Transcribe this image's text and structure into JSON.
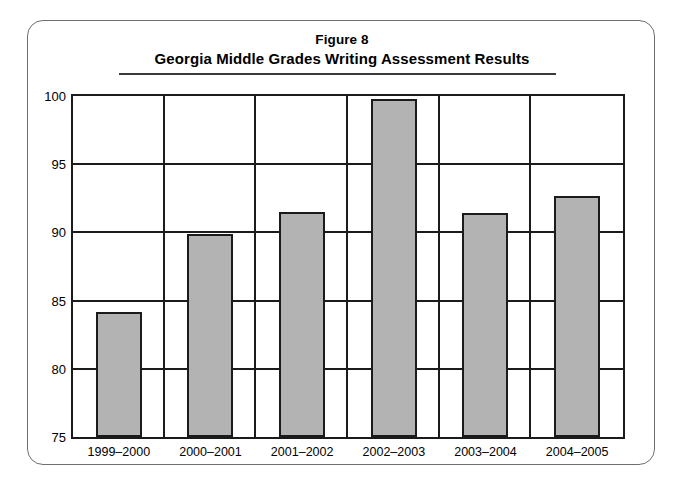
{
  "figure": {
    "title_line_1": "Figure 8",
    "title_line_2": "Georgia Middle Grades Writing Assessment Results"
  },
  "chart_data": {
    "type": "bar",
    "subtitle": "Georgia Middle Grades Writing Assessment Results",
    "xlabel": "",
    "ylabel": "",
    "categories": [
      "1999–2000",
      "2000–2001",
      "2001–2002",
      "2002–2003",
      "2003–2004",
      "2004–2005"
    ],
    "values": [
      84.2,
      89.9,
      91.5,
      99.8,
      91.4,
      92.7
    ],
    "ylim": [
      75,
      100
    ],
    "ytick_labels": [
      "100",
      "95",
      "90",
      "85",
      "80",
      "75"
    ],
    "yticks": [
      100,
      95,
      90,
      85,
      80,
      75
    ],
    "grid": true,
    "legend": null,
    "bar_fill_color": "#b3b3b3",
    "bar_border_color": "#1b1b1b",
    "axis_color": "#1b1b1b",
    "frame_color": "#6f6f73",
    "background_color": "#ffffff"
  }
}
